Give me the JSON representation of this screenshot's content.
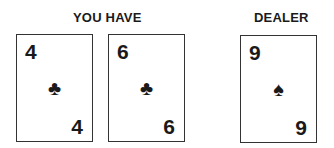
{
  "player": {
    "label": "YOU HAVE",
    "cards": [
      {
        "rank": "4",
        "suit": "clubs",
        "suit_glyph": "♣"
      },
      {
        "rank": "6",
        "suit": "clubs",
        "suit_glyph": "♣"
      }
    ]
  },
  "dealer": {
    "label": "DEALER",
    "cards": [
      {
        "rank": "9",
        "suit": "spades",
        "suit_glyph": "♠"
      }
    ]
  }
}
